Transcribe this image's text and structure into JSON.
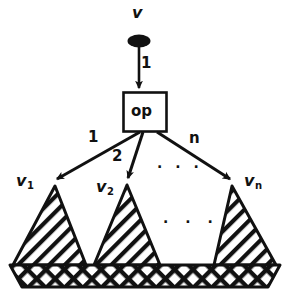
{
  "figure": {
    "colors": {
      "ink": "#111111",
      "paper": "#ffffff"
    },
    "root": {
      "label": "v",
      "node_shape": "filled-ellipse"
    },
    "op_box": {
      "label": "op"
    },
    "incoming_edge": {
      "label": "1"
    },
    "edges": [
      {
        "label": "1",
        "target": "v1"
      },
      {
        "label": "2",
        "target": "v2"
      },
      {
        "label": "n",
        "target": "vn"
      }
    ],
    "children": [
      {
        "name": "v",
        "sub": "1"
      },
      {
        "name": "v",
        "sub": "2"
      },
      {
        "name": "v",
        "sub": "n"
      }
    ],
    "ellipsis_upper": "· · ·",
    "ellipsis_lower": "· · ·",
    "subtrees_fill": "diagonal-hatch",
    "base_band_fill": "cross-hatch"
  }
}
